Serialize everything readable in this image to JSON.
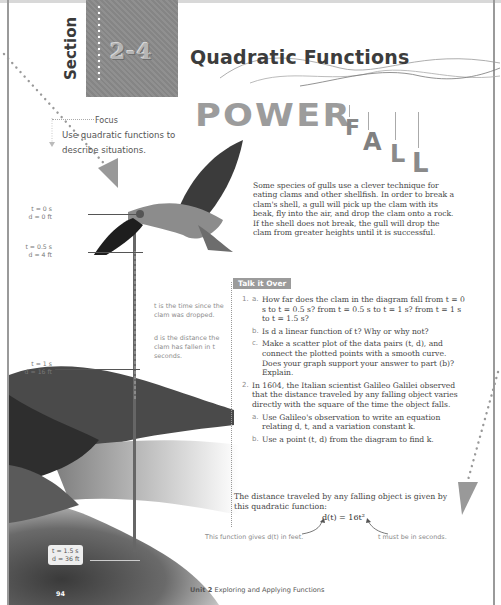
{
  "section": {
    "word": "Section",
    "number": "2-4",
    "title": "Quadratic Functions"
  },
  "banner": {
    "power": "POWER",
    "fall_letters": [
      "F",
      "A",
      "L",
      "L"
    ]
  },
  "focus": {
    "label": "Focus",
    "text": "Use quadratic functions to describe situations."
  },
  "intro": "Some species of gulls use a clever technique for eating clams and other shellfish. In order to break a clam's shell, a gull will pick up the clam with its beak, fly into the air, and drop the clam onto a rock. If the shell does not break, the gull will drop the clam from greater heights until it is successful.",
  "diagram": {
    "labels": [
      {
        "t": "t = 0 s",
        "d": "d = 0 ft"
      },
      {
        "t": "t = 0.5 s",
        "d": "d = 4 ft"
      },
      {
        "t": "t = 1 s",
        "d": "d = 16 ft"
      },
      {
        "t": "t = 1.5 s",
        "d": "d = 36 ft"
      }
    ],
    "note_t": "t is the time since the clam was dropped.",
    "note_d": "d is the distance the clam has fallen in t seconds."
  },
  "talk": {
    "heading": "Talk it Over",
    "q1": {
      "num": "1.",
      "a_letter": "a.",
      "a": "How far does the clam in the diagram fall from t = 0 s to t = 0.5 s? from t = 0.5 s to t = 1 s? from t = 1 s to t = 1.5 s?",
      "b_letter": "b.",
      "b": "Is d a linear function of t? Why or why not?",
      "c_letter": "c.",
      "c": "Make a scatter plot of the data pairs (t, d), and connect the plotted points with a smooth curve. Does your graph support your answer to part (b)? Explain."
    },
    "q2": {
      "num": "2.",
      "text": "In 1604, the Italian scientist Galileo Galilei observed that the distance traveled by any falling object varies directly with the square of the time the object falls.",
      "a_letter": "a.",
      "a": "Use Galileo's observation to write an equation relating d, t, and a variation constant k.",
      "b_letter": "b.",
      "b": "Use a point (t, d) from the diagram to find k."
    }
  },
  "distance": {
    "text": "The distance traveled by any falling object is given by this quadratic function:",
    "formula": "d(t) = 16t²",
    "note_left": "This function gives d(t) in feet.",
    "note_right": "t must be in seconds."
  },
  "footer": {
    "page": "94",
    "unit_bold": "Unit 2",
    "unit_title": "Exploring and Applying Functions"
  }
}
